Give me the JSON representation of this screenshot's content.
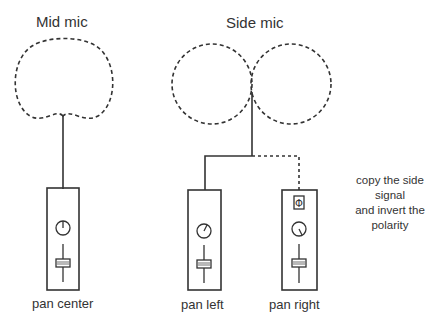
{
  "diagram": {
    "type": "mid-side microphone routing",
    "mid": {
      "title": "Mid mic",
      "pattern": "cardioid",
      "channel_label": "pan center",
      "pan": "center"
    },
    "side": {
      "title": "Side mic",
      "pattern": "figure-8",
      "channels": [
        {
          "label": "pan left",
          "pan": "left",
          "polarity_invert": false
        },
        {
          "label": "pan right",
          "pan": "right",
          "polarity_invert": true
        }
      ]
    },
    "annotation": [
      "copy the side",
      "signal",
      "and invert the",
      "polarity"
    ],
    "phase_symbol": "Φ",
    "colors": {
      "line": "#333333",
      "background": "#ffffff"
    }
  }
}
